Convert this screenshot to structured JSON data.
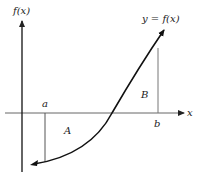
{
  "diagram": {
    "y_axis_label": "f(x)",
    "x_axis_label": "x",
    "curve_label": "y = f(x)",
    "point_a_label": "a",
    "point_b_label": "b",
    "region_a_label": "A",
    "region_b_label": "B",
    "colors": {
      "axis": "#555555",
      "curve": "#111111",
      "text": "#1a1a1a"
    }
  }
}
